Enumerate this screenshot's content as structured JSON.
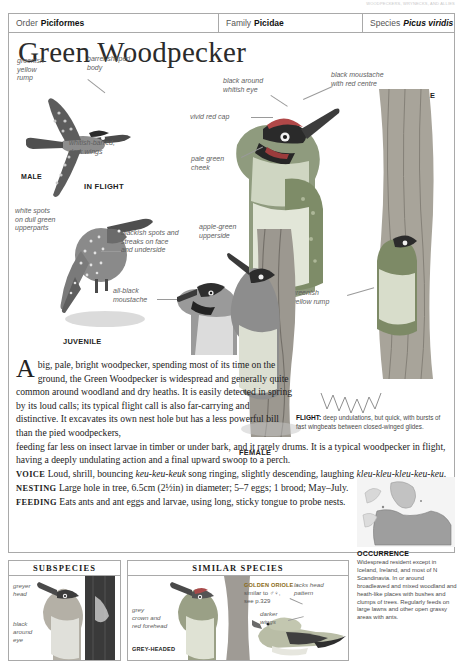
{
  "trim_text": "WOODPECKERS, WRYNECKS, AND ALLIES",
  "taxonomy": {
    "order_label": "Order",
    "order_value": "Piciformes",
    "family_label": "Family",
    "family_value": "Picidae",
    "species_label": "Species",
    "species_value": "Picus viridis"
  },
  "title": "Green Woodpecker",
  "annotations": {
    "greenish_yellow_rump_flight": "greenish\nyellow\nrump",
    "barrel_shaped_body": "barrel-shaped\nbody",
    "whitish_barred_wings": "whitish-barred,\ndark wings",
    "male_flight": "MALE",
    "in_flight": "IN FLIGHT",
    "white_spots": "white spots\non dull green\nupperparts",
    "blackish_spots": "blackish spots and\nstreaks on face\nand underside",
    "all_black_moustache": "all-black\nmoustache",
    "juvenile": "JUVENILE",
    "black_around_eye": "black around\nwhitish eye",
    "vivid_red_cap": "vivid red cap",
    "pale_green_cheek": "pale green\ncheek",
    "apple_green_upperside": "apple-green\nupperside",
    "black_moustache_red": "black moustache\nwith red centre",
    "male_perched": "MALE",
    "greenish_yellow_rump_perched": "greenish\nyellow rump",
    "female": "FEMALE"
  },
  "flight_caption": {
    "label": "FLIGHT:",
    "text": " deep undulations, but quick, with bursts of fast wingbeats between closed-winged glides."
  },
  "account": {
    "dropcap": "A",
    "intro": "big, pale, bright woodpecker, spending most of its time on the ground, the Green Woodpecker is widespread and generally quite common around woodland and dry heaths. It is easily detected in spring by its loud calls; its typical flight call is also far-carrying and distinctive. It excavates its own nest hole but has a less powerful bill than the pied woodpeckers,",
    "continued": "feeding far less on insect larvae in timber or under bark, and it rarely drums. It is a typical woodpecker in flight, having a deeply undulating action and a final upward swoop to a perch.",
    "voice_head": "VOICE",
    "voice_a": " Loud, shrill, bouncing ",
    "voice_call1": "keu-keu-keuk",
    "voice_b": " song ringing, slightly descending, laughing ",
    "voice_call2": "kleu-kleu-kleu-keu-keu",
    "voice_c": ".",
    "nesting_head": "NESTING",
    "nesting_text": " Large hole in tree, 6.5cm (2½in) in diameter; 5–7 eggs; 1 brood; May–July.",
    "feeding_head": "FEEDING",
    "feeding_text": " Eats ants and ant eggs and larvae, using long, sticky tongue to probe nests."
  },
  "occurrence": {
    "title": "OCCURRENCE",
    "text": "Widespread resident except in Iceland, Ireland, and most of N Scandinavia. In or around broadleaved and mixed woodland and heath-like places with bushes and clumps of trees. Regularly feeds on large lawns and other open grassy areas with ants."
  },
  "panels": {
    "subspecies": {
      "heading": "SUBSPECIES",
      "labels": {
        "greyer_head": "greyer\nhead",
        "black_around_eye": "black\naround\neye"
      }
    },
    "similar_species": {
      "heading": "SIMILAR SPECIES",
      "grey_headed": {
        "grey_crown": "grey\ncrown and\nred forehead",
        "name": "GREY-HEADED"
      },
      "golden_oriole": {
        "name": "GOLDEN ORIOLE ♀",
        "note": "similar to ♂♀,\nsee p.329",
        "lacks_head_pattern": "lacks head\npattern",
        "darker_wings": "darker\nwings"
      }
    }
  },
  "colors": {
    "rule": "#a9a9a9",
    "label_grey": "#5e5e5e",
    "ink": "#1a1a1a",
    "ochre": "#8a6a15"
  }
}
